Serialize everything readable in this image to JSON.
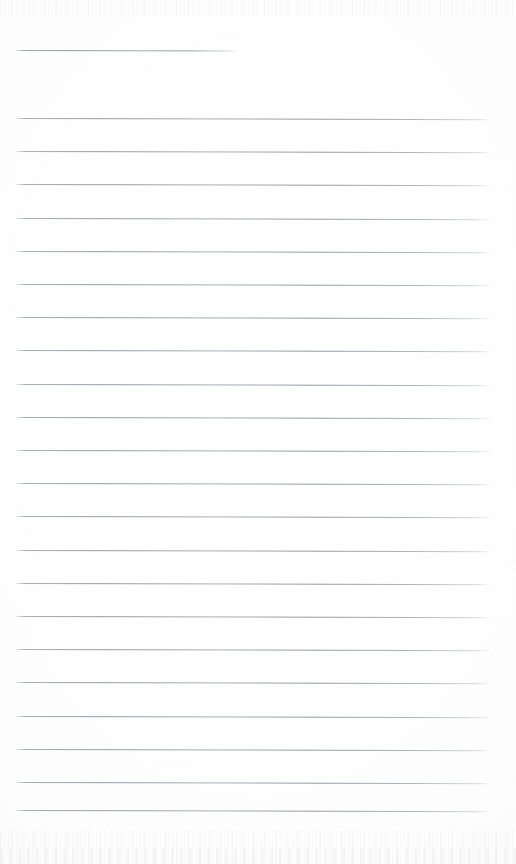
{
  "document": {
    "kind": "scanned-lined-paper",
    "title": "Blank ruled notebook page",
    "page_width": 516,
    "page_height": 864,
    "background_color": "#fdfdfd",
    "rule_color": "#969ca5",
    "written_text": "",
    "content_note": "Page is blank — ruled lines only, no handwriting or printed text"
  },
  "layout": {
    "margin_left": 16,
    "rule_right_edge": 489,
    "short_rule_right_edge": 238,
    "first_rule_y": 50,
    "body_first_rule_y": 118,
    "rule_spacing": 33.2,
    "rule_thickness": 1,
    "rule_tilt_deg": 0.14,
    "bottom_margin_y": 810
  },
  "rules": [
    {
      "id": "rule-header",
      "y": 50,
      "x": 16,
      "width": 222,
      "short": true
    },
    {
      "id": "rule-01",
      "y": 118,
      "x": 16,
      "width": 473,
      "short": false
    },
    {
      "id": "rule-02",
      "y": 151.2,
      "x": 16,
      "width": 473,
      "short": false
    },
    {
      "id": "rule-03",
      "y": 184.4,
      "x": 16,
      "width": 473,
      "short": false
    },
    {
      "id": "rule-04",
      "y": 217.6,
      "x": 16,
      "width": 473,
      "short": false
    },
    {
      "id": "rule-05",
      "y": 250.8,
      "x": 16,
      "width": 473,
      "short": false
    },
    {
      "id": "rule-06",
      "y": 284.0,
      "x": 16,
      "width": 473,
      "short": false
    },
    {
      "id": "rule-07",
      "y": 317.2,
      "x": 16,
      "width": 473,
      "short": false
    },
    {
      "id": "rule-08",
      "y": 350.4,
      "x": 16,
      "width": 473,
      "short": false
    },
    {
      "id": "rule-09",
      "y": 383.6,
      "x": 16,
      "width": 473,
      "short": false
    },
    {
      "id": "rule-10",
      "y": 416.8,
      "x": 16,
      "width": 473,
      "short": false
    },
    {
      "id": "rule-11",
      "y": 450.0,
      "x": 16,
      "width": 473,
      "short": false
    },
    {
      "id": "rule-12",
      "y": 483.2,
      "x": 16,
      "width": 473,
      "short": false
    },
    {
      "id": "rule-13",
      "y": 516.4,
      "x": 16,
      "width": 473,
      "short": false
    },
    {
      "id": "rule-14",
      "y": 549.6,
      "x": 16,
      "width": 473,
      "short": false
    },
    {
      "id": "rule-15",
      "y": 582.8,
      "x": 16,
      "width": 473,
      "short": false
    },
    {
      "id": "rule-16",
      "y": 616.0,
      "x": 16,
      "width": 473,
      "short": false
    },
    {
      "id": "rule-17",
      "y": 649.2,
      "x": 16,
      "width": 473,
      "short": false
    },
    {
      "id": "rule-18",
      "y": 682.4,
      "x": 16,
      "width": 473,
      "short": false
    },
    {
      "id": "rule-19",
      "y": 715.6,
      "x": 16,
      "width": 473,
      "short": false
    },
    {
      "id": "rule-20",
      "y": 748.8,
      "x": 16,
      "width": 473,
      "short": false
    },
    {
      "id": "rule-21",
      "y": 782.0,
      "x": 16,
      "width": 473,
      "short": false
    },
    {
      "id": "rule-22",
      "y": 810.0,
      "x": 16,
      "width": 473,
      "short": false
    }
  ]
}
